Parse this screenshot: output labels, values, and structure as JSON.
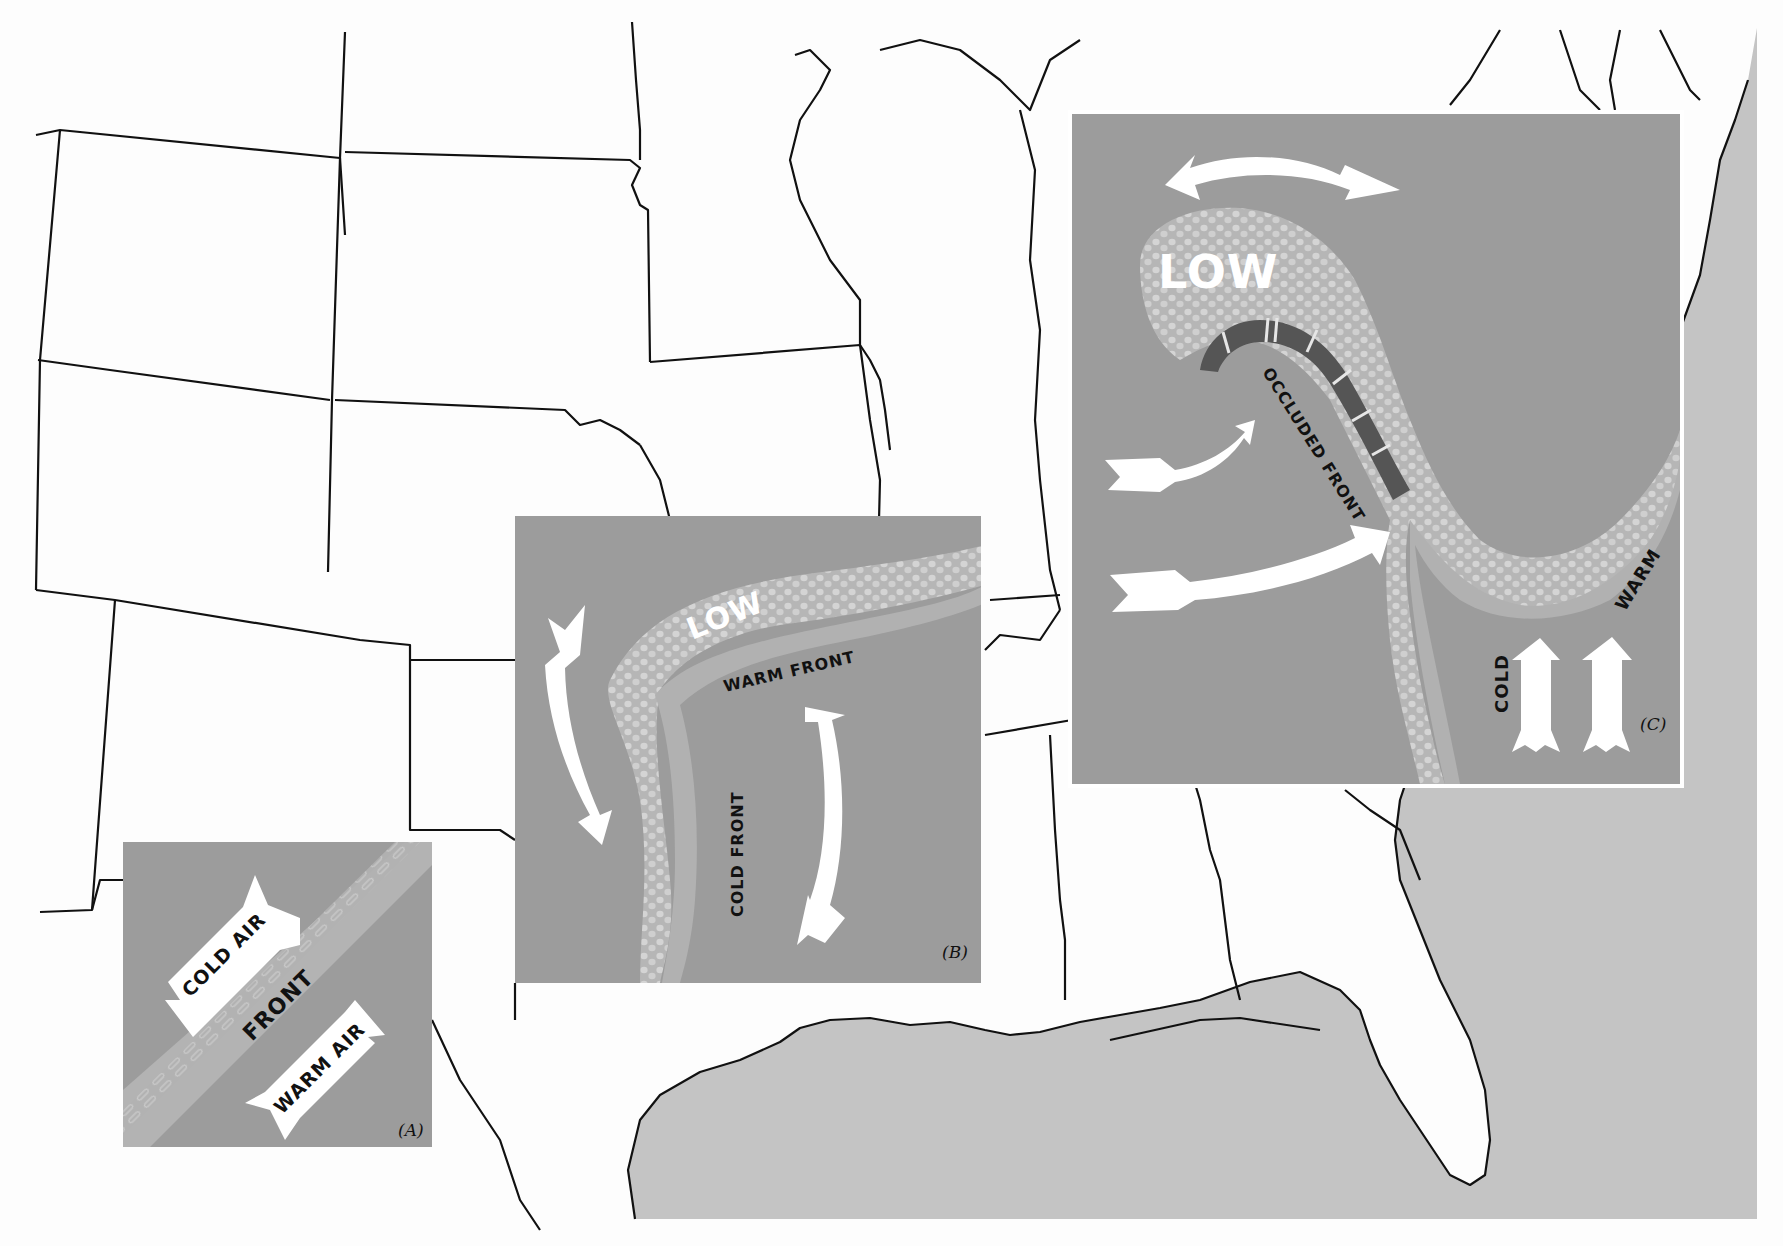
{
  "figure": {
    "type": "weather-fronts-map",
    "colors": {
      "paper": "#fdfdfd",
      "ocean": "#c4c4c4",
      "panel_bg": "#9c9c9c",
      "front_band": "#b4b4b4",
      "cloud_band": "#b8b8b8",
      "cloud_dot": "#d2d2d2",
      "occluded_bar": "#555555",
      "arrow": "#ffffff",
      "state_line": "#111111",
      "text_dark": "#111111",
      "text_light": "#ffffff"
    }
  },
  "panels": [
    {
      "id": "A",
      "caption": "(A)",
      "labels": {
        "cold_air": "COLD AIR",
        "front": "FRONT",
        "warm_air": "WARM AIR"
      }
    },
    {
      "id": "B",
      "caption": "(B)",
      "labels": {
        "low": "LOW",
        "warm_front": "WARM FRONT",
        "cold_front": "COLD FRONT"
      }
    },
    {
      "id": "C",
      "caption": "(C)",
      "labels": {
        "low": "LOW",
        "occluded_front": "OCCLUDED FRONT",
        "cold": "COLD",
        "warm": "WARM"
      }
    }
  ]
}
